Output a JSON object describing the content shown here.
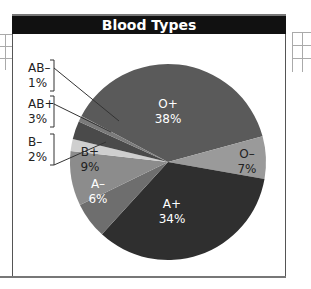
{
  "title": "Blood Types",
  "chart_data": {
    "type": "pie",
    "title": "Blood Types",
    "categories": [
      "O+",
      "O−",
      "A+",
      "A−",
      "B+",
      "B−",
      "AB+",
      "AB−"
    ],
    "values": [
      38,
      7,
      34,
      6,
      9,
      2,
      3,
      1
    ],
    "unit": "%",
    "colors": [
      "#5a5a5a",
      "#9a9a9a",
      "#2f2f2f",
      "#6e6e6e",
      "#8c8c8c",
      "#cfcfcf",
      "#4a4a4a",
      "#7a7a7a"
    ],
    "legend": "inline labels with leader lines for AB−, AB+, B−"
  },
  "labels": {
    "o_pos": {
      "name": "O+",
      "pct": "38%"
    },
    "o_neg": {
      "name": "O–",
      "pct": "7%"
    },
    "a_pos": {
      "name": "A+",
      "pct": "34%"
    },
    "a_neg": {
      "name": "A–",
      "pct": "6%"
    },
    "b_pos": {
      "name": "B+",
      "pct": "9%"
    },
    "b_neg": {
      "name": "B–",
      "pct": "2%"
    },
    "ab_pos": {
      "name": "AB+",
      "pct": "3%"
    },
    "ab_neg": {
      "name": "AB–",
      "pct": "1%"
    }
  }
}
